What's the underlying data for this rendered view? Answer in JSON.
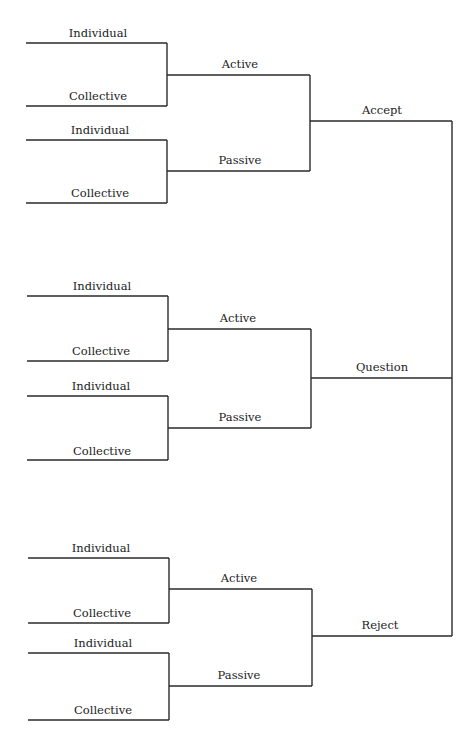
{
  "diagram": {
    "type": "tree",
    "orientation": "right-to-left",
    "line_color": "#2a2a2a",
    "root_labels": [
      "Accept",
      "Question",
      "Reject"
    ],
    "groups": [
      {
        "label": "Accept",
        "children": [
          {
            "label": "Active",
            "children": [
              {
                "label": "Individual"
              },
              {
                "label": "Collective"
              }
            ]
          },
          {
            "label": "Passive",
            "children": [
              {
                "label": "Individual"
              },
              {
                "label": "Collective"
              }
            ]
          }
        ]
      },
      {
        "label": "Question",
        "children": [
          {
            "label": "Active",
            "children": [
              {
                "label": "Individual"
              },
              {
                "label": "Collective"
              }
            ]
          },
          {
            "label": "Passive",
            "children": [
              {
                "label": "Individual"
              },
              {
                "label": "Collective"
              }
            ]
          }
        ]
      },
      {
        "label": "Reject",
        "children": [
          {
            "label": "Active",
            "children": [
              {
                "label": "Individual"
              },
              {
                "label": "Collective"
              }
            ]
          },
          {
            "label": "Passive",
            "children": [
              {
                "label": "Individual"
              },
              {
                "label": "Collective"
              }
            ]
          }
        ]
      }
    ]
  }
}
